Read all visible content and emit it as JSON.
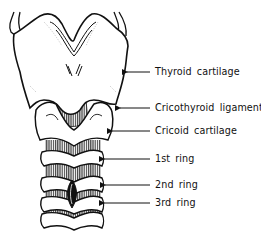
{
  "diagram": {
    "colors": {
      "line": "#111111",
      "background": "#ffffff",
      "shade": "#555555"
    },
    "labels": [
      {
        "id": "thyroid-cartilage",
        "text": "Thyroid cartilage",
        "y": 72,
        "arrow_from": 150,
        "arrow_to": 125
      },
      {
        "id": "cricothyroid-ligament",
        "text": "Cricothyroid ligament",
        "y": 108,
        "arrow_from": 150,
        "arrow_to": 118
      },
      {
        "id": "cricoid-cartilage",
        "text": "Cricoid cartilage",
        "y": 131,
        "arrow_from": 150,
        "arrow_to": 110
      },
      {
        "id": "first-ring",
        "text": "1st ring",
        "y": 159,
        "arrow_from": 150,
        "arrow_to": 102
      },
      {
        "id": "second-ring",
        "text": "2nd ring",
        "y": 185,
        "arrow_from": 150,
        "arrow_to": 103
      },
      {
        "id": "third-ring",
        "text": "3rd ring",
        "y": 203,
        "arrow_from": 150,
        "arrow_to": 102
      }
    ]
  }
}
